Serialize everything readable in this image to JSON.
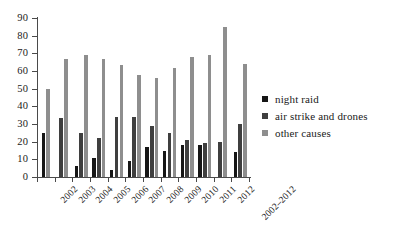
{
  "chart_data": {
    "type": "bar",
    "title": "",
    "subtitle": "",
    "xlabel": "",
    "ylabel": "",
    "ylim": [
      0,
      90
    ],
    "yticks": [
      0,
      10,
      20,
      30,
      40,
      50,
      60,
      70,
      80,
      90
    ],
    "grid": false,
    "legend_position": "right",
    "categories": [
      "2002",
      "2003",
      "2004",
      "2005",
      "2006",
      "2007",
      "2008",
      "2009",
      "2010",
      "2011",
      "2012",
      "2002–2012"
    ],
    "series": [
      {
        "name": "night raid",
        "color": "#161616",
        "values": [
          25,
          0,
          6,
          11,
          4,
          9,
          17,
          15,
          18,
          18,
          0,
          14
        ]
      },
      {
        "name": "air strike and drones",
        "color": "#3f3f3f",
        "values": [
          0,
          33.5,
          25,
          22,
          34,
          34,
          29,
          25,
          21,
          19,
          20,
          30
        ]
      },
      {
        "name": "other causes",
        "color": "#8e8e8e",
        "values": [
          50,
          67,
          69,
          67,
          63.5,
          58,
          56,
          61.5,
          68,
          69,
          85,
          64
        ]
      }
    ]
  },
  "legend": {
    "items": [
      {
        "label": "night raid"
      },
      {
        "label": "air strike and drones"
      },
      {
        "label": "other causes"
      }
    ]
  }
}
